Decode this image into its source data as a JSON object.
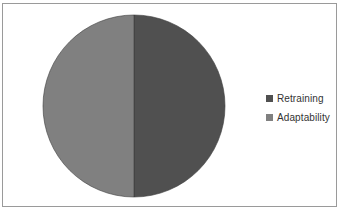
{
  "chart_data": {
    "type": "pie",
    "title": "",
    "categories": [
      "Retraining",
      "Adaptability"
    ],
    "values": [
      50,
      50
    ],
    "colors": [
      "#505050",
      "#808080"
    ],
    "start_angle_deg": 90,
    "direction": "clockwise",
    "legend": {
      "position": "right",
      "entries": [
        "Retraining",
        "Adaptability"
      ]
    },
    "border": true
  },
  "legend": {
    "items": [
      {
        "label": "Retraining",
        "color": "#505050"
      },
      {
        "label": "Adaptability",
        "color": "#808080"
      }
    ]
  }
}
